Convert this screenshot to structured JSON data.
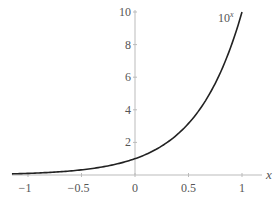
{
  "chart_data": {
    "type": "line",
    "title": "",
    "xlabel": "x",
    "ylabel": "",
    "xlim": [
      -1.15,
      1.1
    ],
    "ylim": [
      0,
      10
    ],
    "x_ticks": [
      -1,
      -0.5,
      0,
      0.5,
      1
    ],
    "x_tick_labels": [
      "−1",
      "−0.5",
      "0",
      "0.5",
      "1"
    ],
    "y_ticks": [
      2,
      4,
      6,
      8,
      10
    ],
    "y_tick_labels": [
      "2",
      "4",
      "6",
      "8",
      "10"
    ],
    "grid": false,
    "series": [
      {
        "name": "10^x",
        "label": "10",
        "label_exponent": "x",
        "function": "10^x",
        "x": [
          -1.15,
          -1,
          -0.75,
          -0.5,
          -0.25,
          0,
          0.25,
          0.5,
          0.75,
          1
        ],
        "values": [
          0.071,
          0.1,
          0.178,
          0.316,
          0.562,
          1,
          1.778,
          3.162,
          5.623,
          10
        ],
        "color": "#222222"
      }
    ]
  }
}
